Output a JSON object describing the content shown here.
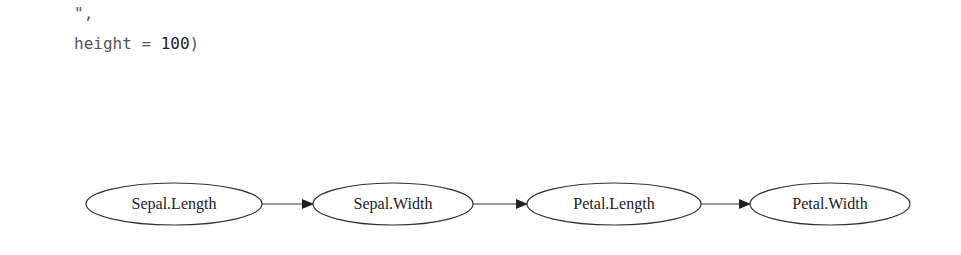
{
  "code": {
    "line1": "\",",
    "line2_key": "height = ",
    "line2_value": "100",
    "line2_close": ")"
  },
  "diagram": {
    "nodes": [
      {
        "id": "n1",
        "label": "Sepal.Length",
        "cx": 174,
        "cy": 204,
        "rx": 88,
        "ry": 21
      },
      {
        "id": "n2",
        "label": "Sepal.Width",
        "cx": 393,
        "cy": 204,
        "rx": 80,
        "ry": 21
      },
      {
        "id": "n3",
        "label": "Petal.Length",
        "cx": 614,
        "cy": 204,
        "rx": 87,
        "ry": 21
      },
      {
        "id": "n4",
        "label": "Petal.Width",
        "cx": 830,
        "cy": 204,
        "rx": 80,
        "ry": 21
      }
    ],
    "edges": [
      {
        "from": "Sepal.Length",
        "to": "Sepal.Width"
      },
      {
        "from": "Sepal.Width",
        "to": "Petal.Length"
      },
      {
        "from": "Petal.Length",
        "to": "Petal.Width"
      }
    ],
    "stroke_color": "#333333"
  }
}
